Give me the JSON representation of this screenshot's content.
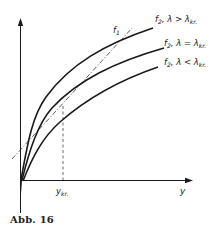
{
  "figure": {
    "caption": "Abb. 16",
    "x_axis_label": "y",
    "critical_point_label": "y",
    "critical_point_subscript": "kr.",
    "line_label": "f",
    "line_label_subscript": "1",
    "curves": [
      {
        "label_f": "f",
        "label_sub": "2",
        "label_rel": ", λ > λ",
        "label_rel_sub": "kr.",
        "relation": "λ > λkr."
      },
      {
        "label_f": "f",
        "label_sub": "2",
        "label_rel": ", λ = λ",
        "label_rel_sub": "kr.",
        "relation": "λ = λkr."
      },
      {
        "label_f": "f",
        "label_sub": "2",
        "label_rel": ", λ < λ",
        "label_rel_sub": "kr.",
        "relation": "λ < λkr."
      }
    ]
  },
  "colors": {
    "ink": "#1a1a1a",
    "background": "#ffffff"
  }
}
